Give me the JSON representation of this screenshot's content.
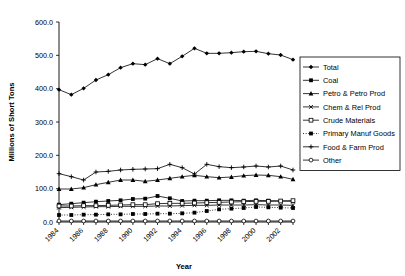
{
  "chart_data": {
    "type": "line",
    "title": "",
    "xlabel": "Year",
    "ylabel": "Millions of Short Tons",
    "ylim": [
      0,
      600
    ],
    "yticks": [
      "0.0",
      "100.0",
      "200.0",
      "300.0",
      "400.0",
      "500.0",
      "600.0"
    ],
    "ytick_values": [
      0,
      100,
      200,
      300,
      400,
      500,
      600
    ],
    "grid": false,
    "legend_position": "right",
    "x": [
      1984,
      1985,
      1986,
      1987,
      1988,
      1989,
      1990,
      1991,
      1992,
      1993,
      1994,
      1995,
      1996,
      1997,
      1998,
      1999,
      2000,
      2001,
      2002,
      2003
    ],
    "xtick_labels": [
      "1984",
      "1986",
      "1988",
      "1990",
      "1992",
      "1994",
      "1996",
      "1998",
      "2000",
      "2002"
    ],
    "xtick_values": [
      1984,
      1986,
      1988,
      1990,
      1992,
      1994,
      1996,
      1998,
      2000,
      2002
    ],
    "series": [
      {
        "name": "Total",
        "marker": "diamond",
        "dash": "solid",
        "values": [
          397,
          382,
          401,
          426,
          442,
          463,
          475,
          472,
          490,
          475,
          497,
          521,
          506,
          506,
          508,
          511,
          512,
          505,
          501,
          487
        ]
      },
      {
        "name": "Coal",
        "marker": "filled-square",
        "dash": "solid",
        "values": [
          52,
          55,
          58,
          61,
          63,
          65,
          69,
          70,
          78,
          71,
          63,
          64,
          64,
          65,
          65,
          64,
          65,
          64,
          63,
          62
        ]
      },
      {
        "name": "Petro & Petro Prod",
        "marker": "triangle",
        "dash": "solid",
        "values": [
          99,
          99,
          103,
          112,
          119,
          126,
          126,
          122,
          126,
          131,
          136,
          140,
          136,
          133,
          135,
          139,
          141,
          140,
          136,
          128
        ]
      },
      {
        "name": "Chem & Rel Prod",
        "marker": "cross",
        "dash": "solid",
        "values": [
          43,
          44,
          45,
          46,
          46,
          47,
          47,
          47,
          48,
          48,
          49,
          50,
          50,
          51,
          51,
          51,
          52,
          51,
          51,
          50
        ]
      },
      {
        "name": "Crude Materials",
        "marker": "open-square",
        "dash": "solid",
        "values": [
          48,
          48,
          49,
          49,
          50,
          51,
          52,
          52,
          55,
          56,
          56,
          57,
          58,
          59,
          60,
          61,
          62,
          62,
          63,
          64
        ]
      },
      {
        "name": "Primary Manuf Goods",
        "marker": "filled-square",
        "dash": "dotted",
        "values": [
          21,
          21,
          22,
          22,
          23,
          23,
          24,
          24,
          25,
          25,
          26,
          28,
          33,
          38,
          40,
          42,
          45,
          44,
          43,
          42
        ]
      },
      {
        "name": "Food & Farm Prod",
        "marker": "plus",
        "dash": "solid",
        "values": [
          145,
          136,
          126,
          150,
          152,
          156,
          158,
          159,
          160,
          173,
          163,
          144,
          173,
          166,
          163,
          165,
          168,
          165,
          168,
          156
        ]
      },
      {
        "name": "Other",
        "marker": "open-circle",
        "dash": "solid",
        "values": [
          3,
          3,
          3,
          3,
          3,
          3,
          3,
          3,
          3,
          3,
          3,
          3,
          3,
          3,
          3,
          3,
          3,
          3,
          3,
          3
        ]
      }
    ]
  },
  "legend": {
    "items": [
      {
        "label": "Total"
      },
      {
        "label": "Coal"
      },
      {
        "label": "Petro & Petro Prod"
      },
      {
        "label": "Chem & Rel Prod"
      },
      {
        "label": "Crude Materials"
      },
      {
        "label": "Primary Manuf Goods"
      },
      {
        "label": "Food & Farm Prod"
      },
      {
        "label": "Other"
      }
    ]
  },
  "colors": {
    "ink": "#000000",
    "background": "#ffffff"
  }
}
